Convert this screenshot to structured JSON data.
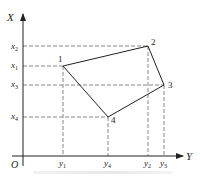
{
  "diagram": {
    "axes": {
      "vertical_label": "X",
      "horizontal_label": "Y",
      "origin_label": "O"
    },
    "vertical_ticks": [
      {
        "base": "x",
        "sub": "2"
      },
      {
        "base": "x",
        "sub": "1"
      },
      {
        "base": "x",
        "sub": "3"
      },
      {
        "base": "x",
        "sub": "4"
      }
    ],
    "horizontal_ticks": [
      {
        "base": "y",
        "sub": "1"
      },
      {
        "base": "y",
        "sub": "4"
      },
      {
        "base": "y",
        "sub": "2"
      },
      {
        "base": "y",
        "sub": "3"
      }
    ],
    "points": [
      {
        "label": "1",
        "coord": "(x1, y1)"
      },
      {
        "label": "2",
        "coord": "(x2, y2)"
      },
      {
        "label": "3",
        "coord": "(x3, y3)"
      },
      {
        "label": "4",
        "coord": "(x4, y4)"
      }
    ],
    "polygon_order": [
      "1",
      "2",
      "3",
      "4"
    ],
    "colors": {
      "axis": "#222222",
      "polygon": "#222222",
      "guide_dashes": "#888888"
    }
  }
}
